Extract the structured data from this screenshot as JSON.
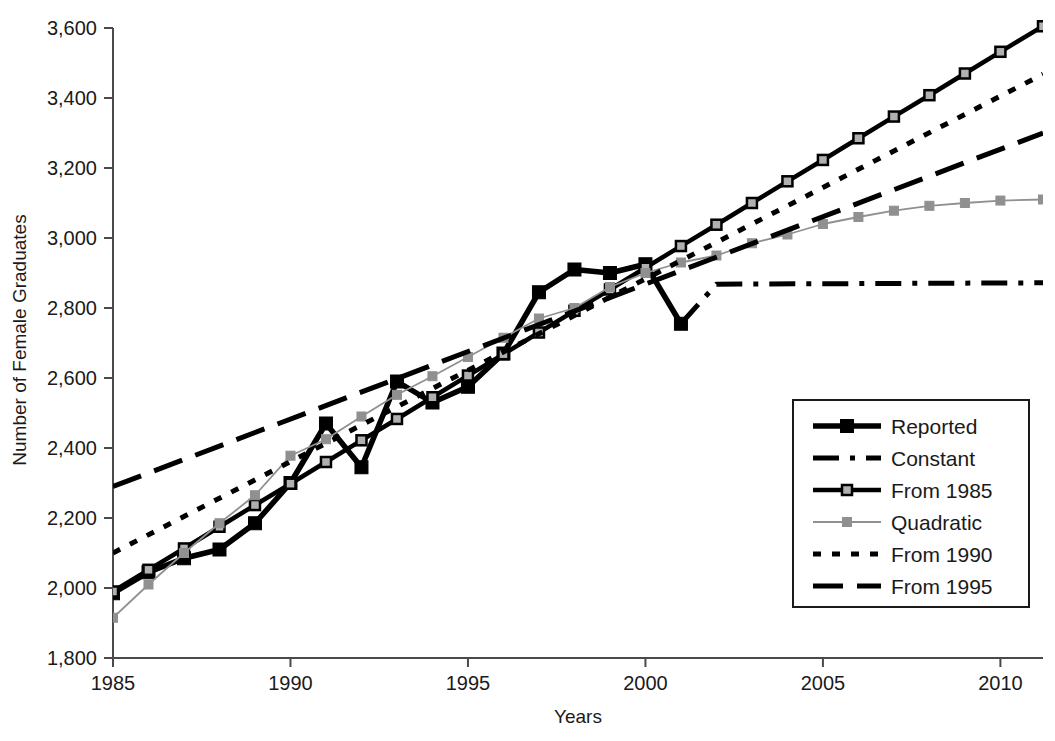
{
  "chart_data": {
    "type": "line",
    "title": "",
    "xlabel": "Years",
    "ylabel": "Number of Female Graduates",
    "xlim": [
      1985,
      2011.2
    ],
    "ylim": [
      1800,
      3600
    ],
    "ytick_step": 200,
    "xtick_step": 5,
    "grid": false,
    "legend_position": "right-lower",
    "x_ticks": [
      "1985",
      "1990",
      "1995",
      "2000",
      "2005",
      "2010"
    ],
    "x_tick_values": [
      1985,
      1990,
      1995,
      2000,
      2005,
      2010
    ],
    "y_ticks": [
      "1,800",
      "2,000",
      "2,200",
      "2,400",
      "2,600",
      "2,800",
      "3,000",
      "3,200",
      "3,400",
      "3,600"
    ],
    "y_tick_values": [
      1800,
      2000,
      2200,
      2400,
      2600,
      2800,
      3000,
      3200,
      3400,
      3600
    ],
    "series": [
      {
        "name": "Reported",
        "style": "solid-thick-filled-square",
        "color": "#000000",
        "x": [
          1985,
          1986,
          1987,
          1988,
          1989,
          1990,
          1991,
          1992,
          1993,
          1994,
          1995,
          1996,
          1997,
          1998,
          1999,
          2000,
          2001
        ],
        "values": [
          1985,
          2045,
          2085,
          2110,
          2185,
          2300,
          2470,
          2345,
          2590,
          2530,
          2575,
          2670,
          2845,
          2910,
          2900,
          2925,
          2755
        ]
      },
      {
        "name": "Constant",
        "style": "dash-dot",
        "color": "#000000",
        "x": [
          2001,
          2002,
          2011.2
        ],
        "values": [
          2755,
          2868,
          2872
        ]
      },
      {
        "name": "From 1985",
        "style": "solid-thick-open-square",
        "color": "#000000",
        "x": [
          1985,
          1986,
          1987,
          1988,
          1989,
          1990,
          1991,
          1992,
          1993,
          1994,
          1995,
          1996,
          1997,
          1998,
          1999,
          2000,
          2001,
          2002,
          2003,
          2004,
          2005,
          2006,
          2007,
          2008,
          2009,
          2010,
          2011.2
        ],
        "values": [
          1990,
          2052,
          2113,
          2175,
          2237,
          2298,
          2360,
          2422,
          2483,
          2545,
          2607,
          2668,
          2730,
          2792,
          2853,
          2915,
          2977,
          3038,
          3100,
          3162,
          3223,
          3285,
          3347,
          3408,
          3470,
          3532,
          3605
        ]
      },
      {
        "name": "Quadratic",
        "style": "thin-gray-square",
        "color": "#909090",
        "x": [
          1985,
          1986,
          1987,
          1988,
          1989,
          1990,
          1991,
          1992,
          1993,
          1994,
          1995,
          1996,
          1997,
          1998,
          1999,
          2000,
          2001,
          2002,
          2003,
          2004,
          2005,
          2006,
          2007,
          2008,
          2009,
          2010,
          2011.2
        ],
        "values": [
          1915,
          2010,
          2100,
          2185,
          2265,
          2378,
          2425,
          2490,
          2552,
          2605,
          2660,
          2715,
          2770,
          2800,
          2860,
          2900,
          2930,
          2950,
          2985,
          3010,
          3040,
          3060,
          3078,
          3092,
          3100,
          3107,
          3110
        ]
      },
      {
        "name": "From 1990",
        "style": "dotted",
        "color": "#000000",
        "x": [
          1985,
          2011.2
        ],
        "values": [
          2100,
          3468
        ]
      },
      {
        "name": "From 1995",
        "style": "long-dash",
        "color": "#000000",
        "x": [
          1985,
          2011.2
        ],
        "values": [
          2290,
          3300
        ]
      }
    ]
  },
  "legend": {
    "items": [
      {
        "label": "Reported",
        "style": "solid-thick-filled-square"
      },
      {
        "label": "Constant",
        "style": "dash-dot"
      },
      {
        "label": "From 1985",
        "style": "solid-thick-open-square"
      },
      {
        "label": "Quadratic",
        "style": "thin-gray-square"
      },
      {
        "label": "From 1990",
        "style": "dotted"
      },
      {
        "label": "From 1995",
        "style": "long-dash"
      }
    ]
  },
  "colors": {
    "line": "#000000",
    "gray_series": "#909090",
    "axis": "#4a4a4a",
    "background": "#ffffff"
  }
}
